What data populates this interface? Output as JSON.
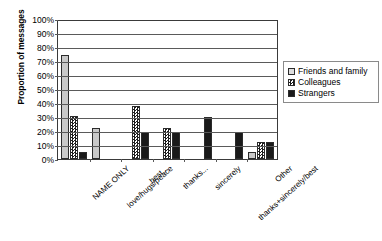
{
  "chart_data": {
    "type": "bar",
    "title": "",
    "subtitle": "",
    "xlabel": "",
    "ylabel": "Proportion of messages",
    "ylim": [
      0,
      100
    ],
    "y_unit": "%",
    "grid": true,
    "legend_position": "right",
    "orientation": "vertical",
    "grouping": "grouped",
    "categories": [
      "NAME ONLY",
      "love/hugs/peace",
      "best...",
      "thanks...",
      "sincerely",
      "thanks+sincerely/best",
      "Other"
    ],
    "y_ticks": [
      "0%",
      "10%",
      "20%",
      "30%",
      "40%",
      "50%",
      "60%",
      "70%",
      "80%",
      "90%",
      "100%"
    ],
    "y_tick_values": [
      0,
      10,
      20,
      30,
      40,
      50,
      60,
      70,
      80,
      90,
      100
    ],
    "series": [
      {
        "name": "Friends and family",
        "color": "#c9c9c9",
        "fill": "solid-light-gray",
        "values": [
          74,
          22,
          0,
          0,
          0,
          0,
          5
        ]
      },
      {
        "name": "Colleagues",
        "color": "#1d1d1d",
        "fill": "checkerboard",
        "values": [
          31,
          0,
          38,
          22,
          0,
          0,
          12
        ]
      },
      {
        "name": "Strangers",
        "color": "#1a1a1a",
        "fill": "solid-black",
        "values": [
          5,
          0,
          19,
          19,
          30,
          19,
          12
        ]
      }
    ]
  }
}
